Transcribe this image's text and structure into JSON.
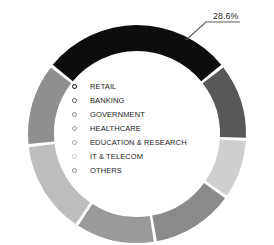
{
  "chart_data": {
    "type": "pie",
    "variant": "donut",
    "title": "",
    "xlabel": "",
    "ylabel": "",
    "grid": false,
    "legend_position": "center-inside",
    "categories": [
      "RETAIL",
      "BANKING",
      "GOVERNMENT",
      "HEALTHCARE",
      "EDUCATION & RESEARCH",
      "IT & TELECOM",
      "OTHERS"
    ],
    "values": [
      28.6,
      11.5,
      9.0,
      12.5,
      12.0,
      14.0,
      12.4
    ],
    "colors": [
      "#0d0d0d",
      "#585858",
      "#cfcfcf",
      "#8a8a8a",
      "#9a9a9a",
      "#bdbdbd",
      "#8f8f8f"
    ],
    "annotations": [
      {
        "text": "28.6%",
        "target_category": "RETAIL",
        "leader_line": true
      }
    ],
    "series": [
      {
        "name": "Share by vertical",
        "points": [
          {
            "label": "RETAIL",
            "value": 28.6,
            "color": "#0d0d0d",
            "data_label": "28.6%"
          },
          {
            "label": "BANKING",
            "value": 11.5,
            "color": "#585858",
            "data_label": ""
          },
          {
            "label": "GOVERNMENT",
            "value": 9.0,
            "color": "#cfcfcf",
            "data_label": ""
          },
          {
            "label": "HEALTHCARE",
            "value": 12.5,
            "color": "#8a8a8a",
            "data_label": ""
          },
          {
            "label": "EDUCATION & RESEARCH",
            "value": 12.0,
            "color": "#9a9a9a",
            "data_label": ""
          },
          {
            "label": "IT & TELECOM",
            "value": 14.0,
            "color": "#bdbdbd",
            "data_label": ""
          },
          {
            "label": "OTHERS",
            "value": 12.4,
            "color": "#8f8f8f",
            "data_label": ""
          }
        ]
      }
    ]
  },
  "legend": {
    "items": [
      {
        "label": "RETAIL",
        "color": "#0d0d0d"
      },
      {
        "label": "BANKING",
        "color": "#585858"
      },
      {
        "label": "GOVERNMENT",
        "color": "#8a8a8a"
      },
      {
        "label": "HEALTHCARE",
        "color": "#9a9a9a"
      },
      {
        "label": "EDUCATION & RESEARCH",
        "color": "#a8a8a8"
      },
      {
        "label": "IT & TELECOM",
        "color": "#cfcfcf"
      },
      {
        "label": "OTHERS",
        "color": "#8f8f8f"
      }
    ]
  },
  "callout": {
    "value_label": "28.6%"
  }
}
